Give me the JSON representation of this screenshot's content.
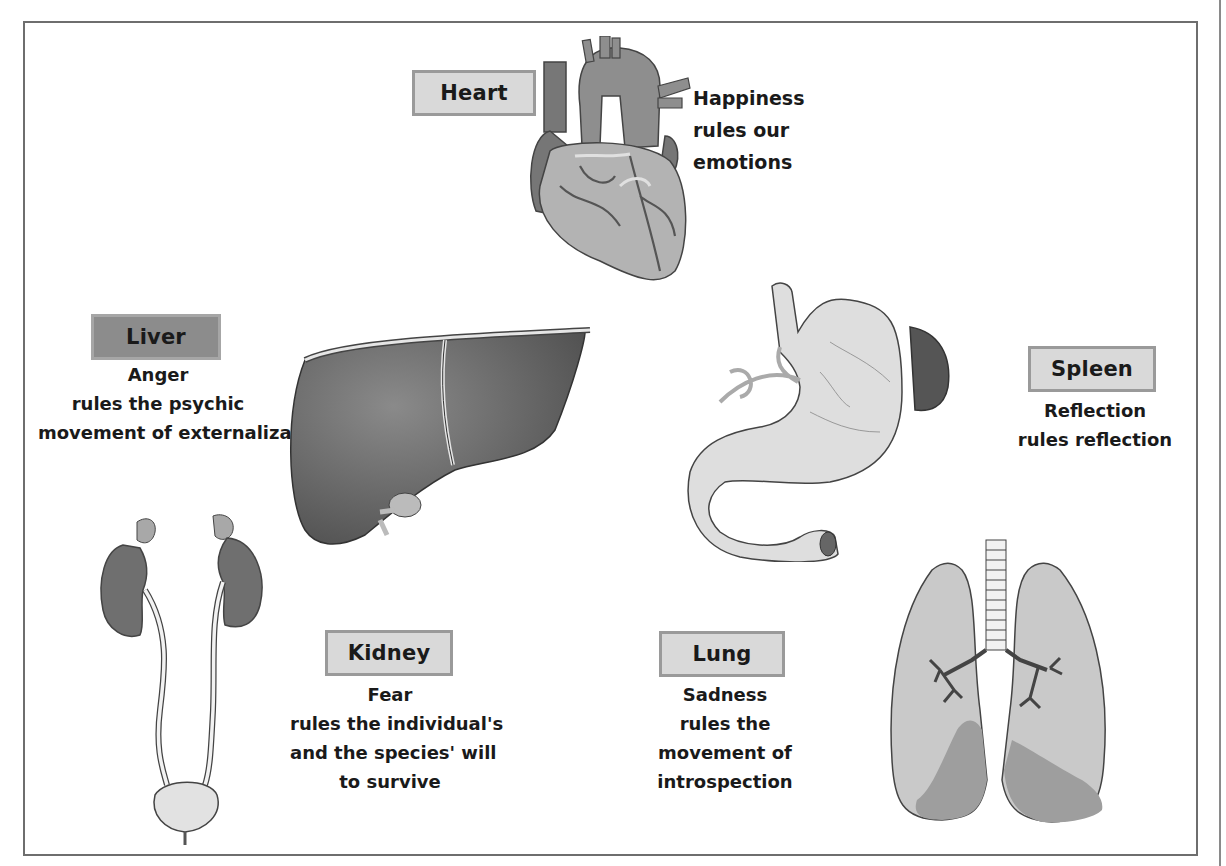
{
  "organs": {
    "heart": {
      "label": "Heart",
      "lines": [
        "Happiness",
        "rules our",
        "emotions"
      ]
    },
    "liver": {
      "label": "Liver",
      "lines": [
        "Anger",
        "rules the psychic",
        "movement of externalization"
      ]
    },
    "spleen": {
      "label": "Spleen",
      "lines": [
        "Reflection",
        "rules reflection"
      ]
    },
    "kidney": {
      "label": "Kidney",
      "lines": [
        "Fear",
        "rules the individual's",
        "and the species' will",
        "to survive"
      ]
    },
    "lung": {
      "label": "Lung",
      "lines": [
        "Sadness",
        "rules the",
        "movement of",
        "introspection"
      ]
    }
  },
  "colors": {
    "frame": "#6e6e6e",
    "label_dark": "#8c8c8c",
    "label_light": "#d9d9d9",
    "organ_dark": "#6f6f6f",
    "organ_mid": "#9a9a9a",
    "organ_light": "#d2d2d2"
  }
}
